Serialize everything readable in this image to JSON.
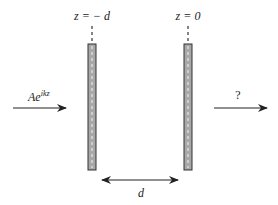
{
  "diagram": {
    "labels": {
      "left_position": "z = − d",
      "right_position": "z = 0",
      "incident_wave": "Ae",
      "incident_exponent": "ikz",
      "transmitted_wave": "?",
      "separation": "d"
    },
    "colors": {
      "slab_fill": "#a8a8a8",
      "slab_stroke": "#333333",
      "arrow": "#222222",
      "background": "#ffffff"
    },
    "elements": {
      "left_slab": {
        "x": 88,
        "y": 44,
        "w": 8,
        "h": 126
      },
      "right_slab": {
        "x": 184,
        "y": 44,
        "w": 8,
        "h": 126
      },
      "incident_arrow": {
        "x1": 13,
        "x2": 66,
        "y": 108
      },
      "transmitted_arrow": {
        "x1": 214,
        "x2": 267,
        "y": 108
      },
      "separation_arrow": {
        "x1": 101,
        "x2": 179,
        "y": 180
      }
    }
  }
}
